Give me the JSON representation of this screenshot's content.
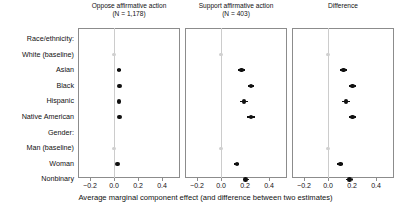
{
  "figure": {
    "x_axis_caption": "Average marginal component effect (and difference between two estimates)",
    "tick_labels": [
      "−0.2",
      "0.0",
      "0.2",
      "0.4"
    ],
    "tick_values": [
      -0.2,
      0.0,
      0.2,
      0.4
    ],
    "accent_color": "#111111",
    "baseline_color": "#d0d0d0",
    "panel_border_color": "#8c8c8c",
    "zero_line_color": "#cccccc"
  },
  "row_labels": [
    {
      "text": "Race/ethnicity:",
      "type": "group"
    },
    {
      "text": "White (baseline)",
      "type": "item"
    },
    {
      "text": "Asian",
      "type": "item"
    },
    {
      "text": "Black",
      "type": "item"
    },
    {
      "text": "Hispanic",
      "type": "item"
    },
    {
      "text": "Native American",
      "type": "item"
    },
    {
      "text": "Gender:",
      "type": "group"
    },
    {
      "text": "Man (baseline)",
      "type": "item"
    },
    {
      "text": "Woman",
      "type": "item"
    },
    {
      "text": "Nonbinary",
      "type": "item"
    }
  ],
  "chart_data": {
    "type": "scatter",
    "title": "",
    "xlabel": "Average marginal component effect (and difference between two estimates)",
    "ylabel": "",
    "xlim": [
      -0.3,
      0.55
    ],
    "xticks": [
      -0.2,
      0.0,
      0.2,
      0.4
    ],
    "grid": false,
    "legend": "none",
    "categories": [
      "Race/ethnicity:",
      "White (baseline)",
      "Asian",
      "Black",
      "Hispanic",
      "Native American",
      "Gender:",
      "Man (baseline)",
      "Woman",
      "Nonbinary"
    ],
    "panels": [
      {
        "title": "Oppose affirmative action\n(N = 1,178)",
        "title_line1": "Oppose affirmative action",
        "title_line2": "(N = 1,178)",
        "n": 1178,
        "points": [
          {
            "label": "White (baseline)",
            "value": 0.0,
            "lo": 0.0,
            "hi": 0.0,
            "baseline": true
          },
          {
            "label": "Asian",
            "value": 0.042,
            "lo": 0.028,
            "hi": 0.056,
            "baseline": false
          },
          {
            "label": "Black",
            "value": 0.046,
            "lo": 0.032,
            "hi": 0.06,
            "baseline": false
          },
          {
            "label": "Hispanic",
            "value": 0.042,
            "lo": 0.028,
            "hi": 0.056,
            "baseline": false
          },
          {
            "label": "Native American",
            "value": 0.048,
            "lo": 0.034,
            "hi": 0.062,
            "baseline": false
          },
          {
            "label": "Man (baseline)",
            "value": 0.0,
            "lo": 0.0,
            "hi": 0.0,
            "baseline": true
          },
          {
            "label": "Woman",
            "value": 0.03,
            "lo": 0.018,
            "hi": 0.042,
            "baseline": false
          },
          {
            "label": "Nonbinary",
            "value": null,
            "lo": null,
            "hi": null,
            "baseline": false
          }
        ]
      },
      {
        "title": "Support affirmative action\n(N = 403)",
        "title_line1": "Support affirmative action",
        "title_line2": "(N = 403)",
        "n": 403,
        "points": [
          {
            "label": "White (baseline)",
            "value": 0.0,
            "lo": 0.0,
            "hi": 0.0,
            "baseline": true
          },
          {
            "label": "Asian",
            "value": 0.17,
            "lo": 0.14,
            "hi": 0.2,
            "baseline": false
          },
          {
            "label": "Black",
            "value": 0.25,
            "lo": 0.222,
            "hi": 0.278,
            "baseline": false
          },
          {
            "label": "Hispanic",
            "value": 0.192,
            "lo": 0.162,
            "hi": 0.222,
            "baseline": false
          },
          {
            "label": "Native American",
            "value": 0.25,
            "lo": 0.22,
            "hi": 0.28,
            "baseline": false
          },
          {
            "label": "Man (baseline)",
            "value": 0.0,
            "lo": 0.0,
            "hi": 0.0,
            "baseline": true
          },
          {
            "label": "Woman",
            "value": 0.132,
            "lo": 0.11,
            "hi": 0.154,
            "baseline": false
          },
          {
            "label": "Nonbinary",
            "value": 0.205,
            "lo": 0.18,
            "hi": 0.23,
            "baseline": false
          }
        ]
      },
      {
        "title": "Difference",
        "title_line1": "Difference",
        "title_line2": "",
        "n": null,
        "points": [
          {
            "label": "White (baseline)",
            "value": 0.0,
            "lo": 0.0,
            "hi": 0.0,
            "baseline": true
          },
          {
            "label": "Asian",
            "value": 0.128,
            "lo": 0.098,
            "hi": 0.158,
            "baseline": false
          },
          {
            "label": "Black",
            "value": 0.205,
            "lo": 0.176,
            "hi": 0.234,
            "baseline": false
          },
          {
            "label": "Hispanic",
            "value": 0.15,
            "lo": 0.12,
            "hi": 0.18,
            "baseline": false
          },
          {
            "label": "Native American",
            "value": 0.205,
            "lo": 0.175,
            "hi": 0.235,
            "baseline": false
          },
          {
            "label": "Man (baseline)",
            "value": 0.0,
            "lo": 0.0,
            "hi": 0.0,
            "baseline": true
          },
          {
            "label": "Woman",
            "value": 0.102,
            "lo": 0.078,
            "hi": 0.126,
            "baseline": false
          },
          {
            "label": "Nonbinary",
            "value": 0.18,
            "lo": 0.154,
            "hi": 0.206,
            "baseline": false
          }
        ]
      }
    ]
  }
}
